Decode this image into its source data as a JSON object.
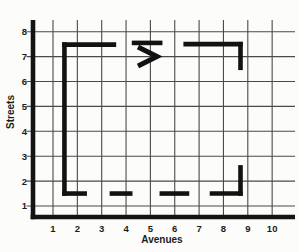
{
  "figure": {
    "x_axis": {
      "label": "Avenues",
      "ticks": [
        "1",
        "2",
        "3",
        "4",
        "5",
        "6",
        "7",
        "8",
        "9",
        "10"
      ]
    },
    "y_axis": {
      "label": "Streets",
      "ticks": [
        "1",
        "2",
        "3",
        "4",
        "5",
        "6",
        "7",
        "8"
      ]
    },
    "colors": {
      "background": "#fcfcfa",
      "grid": "#4a4a4a",
      "axis": "#141414",
      "route": "#121212",
      "text": "#1c1c1c"
    }
  },
  "route": {
    "segments": [
      {
        "name": "west-leg",
        "a1": 1.47,
        "s1": 1.5,
        "a2": 1.47,
        "s2": 7.48
      },
      {
        "name": "north-leg-1",
        "a1": 1.47,
        "s1": 7.48,
        "a2": 3.5,
        "s2": 7.48
      },
      {
        "name": "north-leg-dash",
        "a1": 4.33,
        "s1": 7.55,
        "a2": 5.4,
        "s2": 7.55
      },
      {
        "name": "north-leg-2",
        "a1": 6.45,
        "s1": 7.5,
        "a2": 8.7,
        "s2": 7.5
      },
      {
        "name": "east-leg-top",
        "a1": 8.7,
        "s1": 7.5,
        "a2": 8.7,
        "s2": 6.55
      },
      {
        "name": "south-leg-1",
        "a1": 1.47,
        "s1": 1.5,
        "a2": 2.3,
        "s2": 1.5
      },
      {
        "name": "south-leg-dash-1",
        "a1": 3.42,
        "s1": 1.5,
        "a2": 4.17,
        "s2": 1.5
      },
      {
        "name": "south-leg-dash-2",
        "a1": 5.47,
        "s1": 1.5,
        "a2": 6.5,
        "s2": 1.5
      },
      {
        "name": "south-leg-2",
        "a1": 7.53,
        "s1": 1.5,
        "a2": 8.7,
        "s2": 1.5
      },
      {
        "name": "east-leg-bottom",
        "a1": 8.7,
        "s1": 1.5,
        "a2": 8.7,
        "s2": 2.55
      }
    ],
    "direction_arrow": {
      "points": [
        [
          4.49,
          7.38
        ],
        [
          5.27,
          7.0
        ],
        [
          4.49,
          6.62
        ]
      ]
    }
  }
}
